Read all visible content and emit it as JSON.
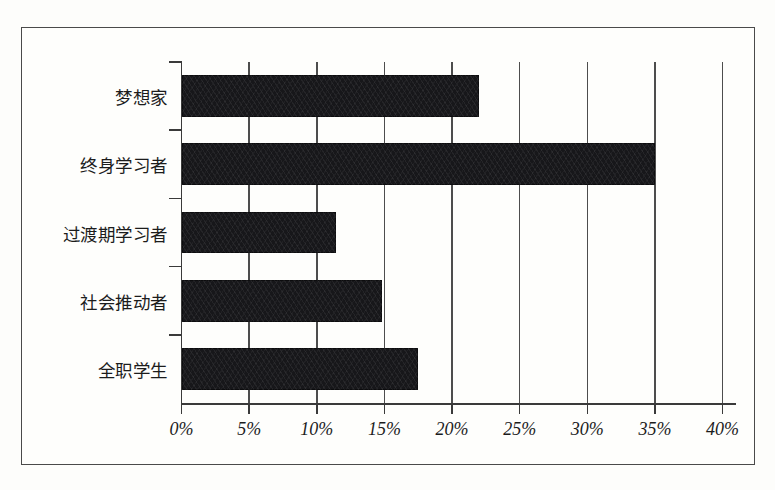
{
  "figure": {
    "background_color": "#fdfdfb",
    "frame_color": "#4a4a4a",
    "bar_color": "#17171a",
    "grid_color": "#4d4d4d"
  },
  "chart_data": {
    "type": "bar",
    "orientation": "horizontal",
    "title": "",
    "subtitle": "",
    "xlabel": "",
    "ylabel": "",
    "categories": [
      "梦想家",
      "终身学习者",
      "过渡期学习者",
      "社会推动者",
      "全职学生"
    ],
    "values": [
      22,
      35,
      11.4,
      14.8,
      17.5
    ],
    "value_labels": [
      "",
      "",
      "",
      "",
      ""
    ],
    "xlim": [
      0,
      40
    ],
    "xticks": [
      0,
      5,
      10,
      15,
      20,
      25,
      30,
      35,
      40
    ],
    "xtick_labels": [
      "0%",
      "5%",
      "10%",
      "15%",
      "20%",
      "25%",
      "30%",
      "35%",
      "40%"
    ],
    "grid": "vertical",
    "legend": null,
    "legend_position": "none",
    "annotations": []
  }
}
